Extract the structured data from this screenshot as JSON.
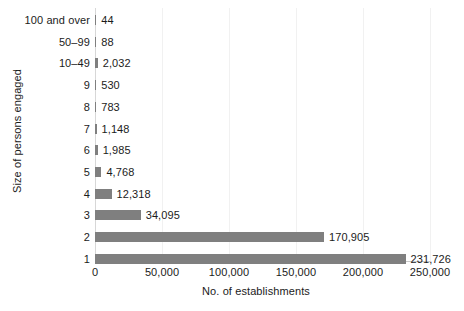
{
  "chart_data": {
    "type": "bar",
    "orientation": "horizontal",
    "title": "",
    "xlabel": "No. of establishments",
    "ylabel": "Size of persons engaged",
    "categories": [
      "100 and over",
      "50–99",
      "10–49",
      "9",
      "8",
      "7",
      "6",
      "5",
      "4",
      "3",
      "2",
      "1"
    ],
    "values": [
      44,
      88,
      2032,
      530,
      783,
      1148,
      1985,
      4768,
      12318,
      34095,
      170905,
      231726
    ],
    "value_labels": [
      "44",
      "88",
      "2,032",
      "530",
      "783",
      "1,148",
      "1,985",
      "4,768",
      "12,318",
      "34,095",
      "170,905",
      "231,726"
    ],
    "xlim": [
      0,
      250000
    ],
    "xticks": [
      0,
      50000,
      100000,
      150000,
      200000,
      250000
    ],
    "xtick_labels": [
      "0",
      "50,000",
      "100,000",
      "150,000",
      "200,000",
      "250,000"
    ],
    "grid": "vertical-only",
    "legend": "none",
    "bar_color": "#7f7f7f",
    "gridline_color": "#f1f1f1",
    "axis_color": "#c9c9c9",
    "text_color": "#1b1b1b",
    "background_color": "#ffffff"
  }
}
